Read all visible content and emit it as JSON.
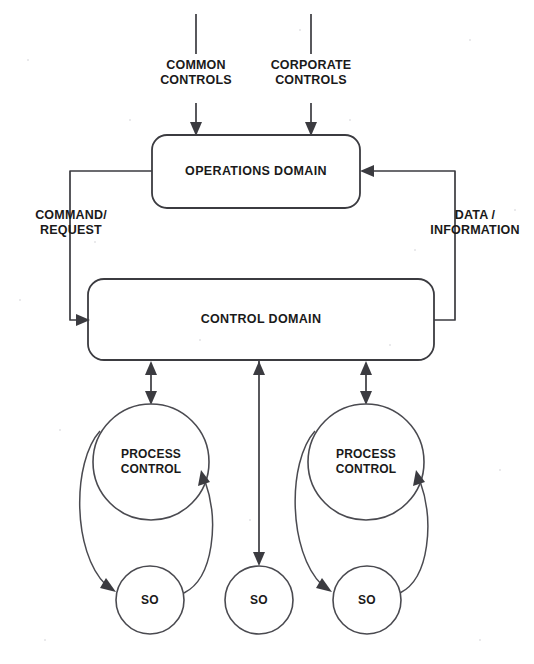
{
  "diagram": {
    "background_color": "#ffffff",
    "line_color": "#3b3b40",
    "text_color": "#1a1a1a",
    "top_inputs": [
      {
        "id": "common-controls",
        "label": "COMMON\nCONTROLS"
      },
      {
        "id": "corporate-controls",
        "label": "CORPORATE\nCONTROLS"
      }
    ],
    "boxes": [
      {
        "id": "operations-domain",
        "label": "OPERATIONS DOMAIN"
      },
      {
        "id": "control-domain",
        "label": "CONTROL DOMAIN"
      }
    ],
    "edge_labels": [
      {
        "id": "command-request",
        "label": "COMMAND/\nREQUEST"
      },
      {
        "id": "data-information",
        "label": "DATA /\nINFORMATION"
      }
    ],
    "process_circles": [
      {
        "id": "process-control-left",
        "label": "PROCESS\nCONTROL"
      },
      {
        "id": "process-control-right",
        "label": "PROCESS\nCONTROL"
      }
    ],
    "so_circles": [
      {
        "id": "so-left",
        "label": "SO"
      },
      {
        "id": "so-middle",
        "label": "SO"
      },
      {
        "id": "so-right",
        "label": "SO"
      }
    ]
  }
}
